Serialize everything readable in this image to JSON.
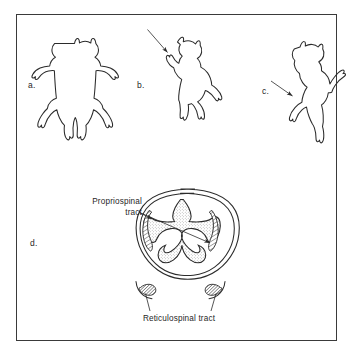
{
  "figure": {
    "type": "scientific-line-diagram",
    "background_color": "#ffffff",
    "ink_color": "#2b2b2b",
    "frame": {
      "visible": true,
      "border_color": "#3a3a3a"
    }
  },
  "panels": [
    {
      "id": "a",
      "letter": "a.",
      "icon": "cat-prone-dorsal-view-icon",
      "description": "Cat seen from above with limbs splayed outward, lying prone"
    },
    {
      "id": "b",
      "letter": "b.",
      "icon": "cat-rearing-icon",
      "description": "Cat rearing upright with arrow directed at head and neck",
      "arrow": {
        "present": true,
        "direction": "down-right",
        "target": "head"
      }
    },
    {
      "id": "c",
      "letter": "c.",
      "icon": "cat-reaching-icon",
      "description": "Cat reaching upward with arrow directed at forelimb",
      "arrow": {
        "present": true,
        "direction": "down-right",
        "target": "forelimb"
      }
    },
    {
      "id": "d",
      "letter": "d.",
      "icon": "spinal-cord-cross-section-icon",
      "description": "Transverse section of spinal cord with stippled butterfly grey matter and hatched tracts"
    }
  ],
  "labels": {
    "propriospinal": {
      "line1": "Propriospinal",
      "line2": "tract"
    },
    "reticulospinal": {
      "text": "Reticulospinal  tract"
    }
  },
  "cord_features": [
    {
      "name": "grey-matter",
      "shape": "butterfly",
      "fill": "stipple"
    },
    {
      "name": "propriospinal-tract-left",
      "fill": "diagonal-hatch"
    },
    {
      "name": "propriospinal-tract-right",
      "fill": "diagonal-hatch"
    },
    {
      "name": "reticulospinal-tract-left",
      "fill": "dense-hatch"
    },
    {
      "name": "reticulospinal-tract-right",
      "fill": "dense-hatch"
    },
    {
      "name": "dorsal-median-sulcus"
    },
    {
      "name": "ventral-median-fissure"
    }
  ]
}
